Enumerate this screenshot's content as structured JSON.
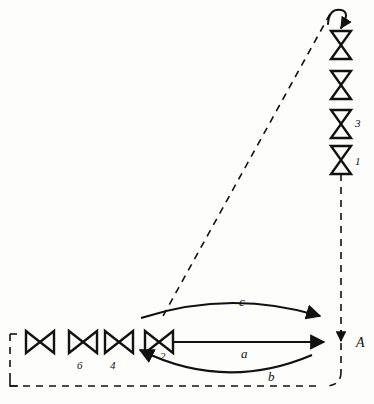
{
  "diagram": {
    "background_color": "#fdfdfc",
    "stroke_color": "#111111",
    "nodes": {
      "vertical_valves": [
        {
          "id": "v-top",
          "label": "",
          "cx": 341,
          "cy": 43
        },
        {
          "id": "v-second",
          "label": "",
          "cx": 341,
          "cy": 83
        },
        {
          "id": "v-third",
          "label": "3",
          "cx": 341,
          "cy": 122
        },
        {
          "id": "v-fourth",
          "label": "1",
          "cx": 341,
          "cy": 158
        }
      ],
      "horizontal_valves": [
        {
          "id": "h-1",
          "label": "",
          "cx": 38,
          "cy": 342
        },
        {
          "id": "h-2",
          "label": "6",
          "cx": 81,
          "cy": 342
        },
        {
          "id": "h-3",
          "label": "4",
          "cx": 117,
          "cy": 342
        },
        {
          "id": "h-4",
          "label": "2",
          "cx": 157,
          "cy": 342
        }
      ]
    },
    "labels": {
      "node_A": "A",
      "arc_top": "c",
      "arc_middle": "a",
      "arc_bottom": "b",
      "valve_3": "3",
      "valve_1": "1",
      "valve_6": "6",
      "valve_4": "4",
      "valve_2": "2"
    },
    "flows": [
      {
        "name": "c",
        "direction": "left-to-right",
        "from": "h-4",
        "to": "A",
        "style": "solid-arc-above"
      },
      {
        "name": "a",
        "direction": "left-to-right",
        "from": "h-4",
        "to": "A",
        "style": "solid-straight"
      },
      {
        "name": "b",
        "direction": "right-to-left",
        "from": "A",
        "to": "h-4",
        "style": "solid-arc-below"
      }
    ],
    "dashed_paths": {
      "diagonal": "from top-right hook down-left to arc c origin",
      "vertical_right": "from valve 1 down to node A and bottom corner",
      "bottom_horizontal": "along base from left corner to bottom-right corner",
      "left_vertical": "short left edge with top stub"
    }
  }
}
